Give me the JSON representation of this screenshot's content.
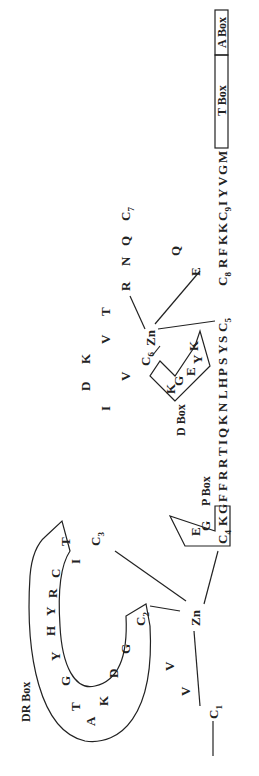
{
  "labels": {
    "dr_box": "DR Box",
    "p_box": "P Box",
    "d_box": "D Box",
    "t_box": "T Box",
    "a_box": "A Box",
    "zn1": "Zn",
    "zn2": "Zn"
  },
  "finger1": {
    "c1": "C",
    "c1_sub": "1",
    "c2": "C",
    "c2_sub": "2",
    "c3": "C",
    "c3_sub": "3",
    "c4": "C",
    "c4_sub": "4",
    "pre_c2": [
      "V",
      "V"
    ],
    "loop": [
      "G",
      "D",
      "K",
      "A",
      "T",
      "G",
      "Y",
      "H",
      "Y",
      "R",
      "C",
      "I",
      "T"
    ],
    "p_box_residues": [
      "E",
      "G",
      "K",
      "G"
    ]
  },
  "linker": [
    "F",
    "F",
    "R",
    "R",
    "T",
    "I",
    "Q",
    "K",
    "N",
    "L",
    "H",
    "P",
    "S",
    "Y",
    "S"
  ],
  "finger2": {
    "c5": "C",
    "c5_sub": "5",
    "c6": "C",
    "c6_sub": "6",
    "c7": "C",
    "c7_sub": "7",
    "c8": "C",
    "c8_sub": "8",
    "d_box_residues": [
      "K",
      "G",
      "E",
      "Y",
      "K"
    ],
    "loop": [
      "V",
      "I",
      "D",
      "K",
      "V",
      "T",
      "R",
      "N",
      "Q"
    ],
    "post_c7": [
      "Q",
      "E"
    ]
  },
  "tail": {
    "after_c8": [
      "R",
      "F",
      "K",
      "K"
    ],
    "c9": "C",
    "c9_sub": "9",
    "after_c9": [
      "I",
      "Y",
      "V",
      "G",
      "M"
    ]
  }
}
